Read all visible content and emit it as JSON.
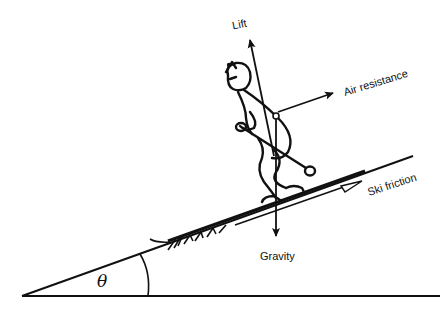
{
  "diagram": {
    "labels": {
      "lift": "Lift",
      "air_resistance": "Air resistance",
      "ski_friction": "Ski friction",
      "gravity": "Gravity",
      "angle": "θ"
    },
    "colors": {
      "ink": "#111111",
      "background": "#ffffff"
    }
  }
}
